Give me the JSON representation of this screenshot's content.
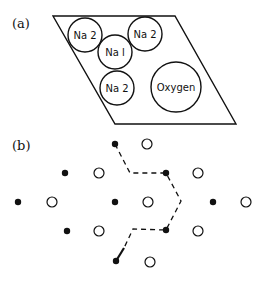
{
  "figure": {
    "panel_a": {
      "label": "(a)",
      "unit_cell": {
        "shape": "parallelogram",
        "corners": [
          [
            53,
            16
          ],
          [
            175,
            16
          ],
          [
            236,
            124
          ],
          [
            115,
            124
          ]
        ]
      },
      "atoms": [
        {
          "label": "Na 2",
          "cx": 85,
          "cy": 35,
          "r": 17
        },
        {
          "label": "Na 2",
          "cx": 145,
          "cy": 34,
          "r": 17
        },
        {
          "label": "Na l",
          "cx": 115,
          "cy": 52,
          "r": 17
        },
        {
          "label": "Na 2",
          "cx": 117,
          "cy": 88,
          "r": 17
        },
        {
          "label": "Oxygen",
          "cx": 176,
          "cy": 87,
          "r": 25
        }
      ]
    },
    "panel_b": {
      "label": "(b)",
      "filled_dots": [
        [
          115,
          144
        ],
        [
          65,
          173
        ],
        [
          166,
          173
        ],
        [
          18,
          202
        ],
        [
          115,
          202
        ],
        [
          213,
          202
        ],
        [
          67,
          231
        ],
        [
          166,
          230
        ],
        [
          116,
          261
        ]
      ],
      "open_circles": [
        [
          147,
          144
        ],
        [
          99,
          173
        ],
        [
          198,
          173
        ],
        [
          52,
          202
        ],
        [
          148,
          202
        ],
        [
          246,
          202
        ],
        [
          99,
          231
        ],
        [
          198,
          231
        ],
        [
          150,
          262
        ]
      ],
      "dashed_path": [
        [
          115,
          144
        ],
        [
          130,
          173
        ],
        [
          166,
          173
        ],
        [
          181,
          201
        ],
        [
          166,
          230
        ],
        [
          133,
          229
        ],
        [
          124,
          248
        ]
      ],
      "arrow_segment": [
        [
          124,
          248
        ],
        [
          116,
          261
        ]
      ]
    }
  },
  "colors": {
    "ink": "#111111",
    "background": "#ffffff"
  }
}
